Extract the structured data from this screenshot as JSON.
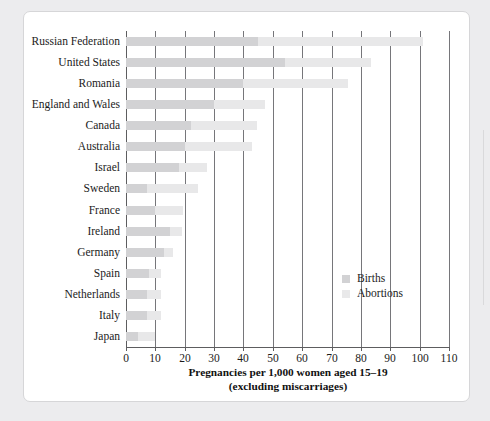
{
  "chart_data": {
    "type": "bar",
    "orientation": "horizontal",
    "stacked": true,
    "title": "",
    "xlabel": "Pregnancies per 1,000 women aged 15–19 (excluding miscarriages)",
    "xlabel_line1": "Pregnancies per 1,000 women aged 15–19",
    "xlabel_line2": "(excluding miscarriages)",
    "ylabel": "",
    "xlim": [
      0,
      110
    ],
    "xticks": [
      0,
      10,
      20,
      30,
      40,
      50,
      60,
      70,
      80,
      90,
      100,
      110
    ],
    "xtick_labels": [
      "0",
      "10",
      "20",
      "30",
      "40",
      "50",
      "60",
      "70",
      "80",
      "90",
      "100",
      "110"
    ],
    "grid": true,
    "grid_axis": "x",
    "legend_position": "center-right-inside",
    "categories": [
      "Russian Federation",
      "United States",
      "Romania",
      "England and Wales",
      "Canada",
      "Australia",
      "Israel",
      "Sweden",
      "France",
      "Ireland",
      "Germany",
      "Spain",
      "Netherlands",
      "Italy",
      "Japan"
    ],
    "series": [
      {
        "name": "Births",
        "color": "#d2d2d4",
        "values": [
          45.0,
          54.0,
          40.0,
          30.0,
          22.0,
          20.0,
          18.0,
          7.0,
          10.0,
          15.0,
          13.0,
          8.0,
          7.0,
          7.0,
          4.0
        ]
      },
      {
        "name": "Abortions",
        "color": "#e8e8e9",
        "values": [
          56.0,
          29.5,
          35.5,
          17.5,
          22.5,
          23.0,
          9.5,
          17.5,
          9.5,
          4.0,
          3.0,
          4.0,
          5.0,
          5.0,
          6.0
        ]
      }
    ],
    "totals": [
      101.0,
      83.5,
      75.5,
      47.5,
      44.5,
      43.0,
      27.5,
      24.5,
      19.5,
      19.0,
      16.0,
      12.0,
      12.0,
      12.0,
      10.0
    ]
  },
  "legend": {
    "items": [
      {
        "label": "Births",
        "color": "#d2d2d4"
      },
      {
        "label": "Abortions",
        "color": "#e9e9ea"
      }
    ]
  },
  "colors": {
    "births": "#d2d2d4",
    "abortions": "#e8e8e9",
    "axis": "#5d5d5f",
    "grid": "#76767a",
    "text": "#1b1b1b",
    "card_background": "#ffffff",
    "page_background": "#ececee",
    "card_border": "#d6d6d8"
  }
}
